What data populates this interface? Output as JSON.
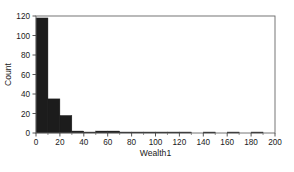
{
  "chart_data": {
    "type": "bar",
    "title": "",
    "subtitle": "",
    "xlabel": "Wealth1",
    "ylabel": "Count",
    "xlim": [
      0,
      200
    ],
    "ylim": [
      0,
      120
    ],
    "grid": false,
    "legend": false,
    "bin_width": 10,
    "bar_color": "#1c1c1c",
    "frame_color": "#555555",
    "x_ticks": [
      0,
      20,
      40,
      60,
      80,
      100,
      120,
      140,
      160,
      180,
      200
    ],
    "x_tick_labels": [
      "0",
      "20",
      "40",
      "60",
      "80",
      "100",
      "120",
      "140",
      "160",
      "180",
      "200"
    ],
    "x_minor_ticks": [
      10,
      30,
      50,
      70,
      90,
      110,
      130,
      150,
      170,
      190
    ],
    "y_ticks": [
      0,
      20,
      40,
      60,
      80,
      100,
      120
    ],
    "y_tick_labels": [
      "0",
      "20",
      "40",
      "60",
      "80",
      "100",
      "120"
    ],
    "categories": [
      "0-10",
      "10-20",
      "20-30",
      "30-40",
      "40-50",
      "50-60",
      "60-70",
      "70-80",
      "80-90",
      "90-100",
      "100-110",
      "110-120",
      "120-130",
      "130-140",
      "140-150",
      "150-160",
      "160-170",
      "170-180",
      "180-190",
      "190-200"
    ],
    "bin_starts": [
      0,
      10,
      20,
      30,
      40,
      50,
      60,
      70,
      80,
      90,
      100,
      110,
      120,
      130,
      140,
      150,
      160,
      170,
      180,
      190
    ],
    "values": [
      118,
      35,
      18,
      2,
      1,
      2,
      2,
      1,
      1,
      1,
      1,
      1,
      1,
      0,
      1,
      0,
      1,
      0,
      1,
      0
    ]
  }
}
